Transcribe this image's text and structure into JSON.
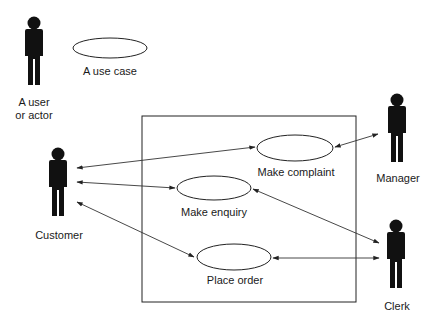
{
  "diagram": {
    "type": "UML use case diagram",
    "colors": {
      "ink": "#111111",
      "line": "#333333",
      "background": "#ffffff"
    },
    "legend": {
      "actor_label_line1": "A user",
      "actor_label_line2": "or actor",
      "use_case_label": "A use case"
    },
    "system_boundary": {
      "x": 142,
      "y": 116,
      "width": 214,
      "height": 186
    },
    "actors": [
      {
        "id": "customer",
        "label": "Customer"
      },
      {
        "id": "manager",
        "label": "Manager"
      },
      {
        "id": "clerk",
        "label": "Clerk"
      }
    ],
    "use_cases": [
      {
        "id": "make-complaint",
        "label": "Make complaint"
      },
      {
        "id": "make-enquiry",
        "label": "Make enquiry"
      },
      {
        "id": "place-order",
        "label": "Place order"
      }
    ],
    "associations": [
      {
        "from": "customer",
        "to": "make-complaint",
        "bidirectional": true
      },
      {
        "from": "customer",
        "to": "make-enquiry",
        "bidirectional": true
      },
      {
        "from": "customer",
        "to": "place-order",
        "bidirectional": true
      },
      {
        "from": "manager",
        "to": "make-complaint",
        "bidirectional": true
      },
      {
        "from": "clerk",
        "to": "make-enquiry",
        "bidirectional": true
      },
      {
        "from": "clerk",
        "to": "place-order",
        "bidirectional": true
      }
    ]
  }
}
